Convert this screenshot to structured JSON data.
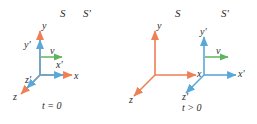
{
  "figure": {
    "background": "#ffffff",
    "width": 257,
    "height": 124,
    "colors": {
      "frame_S": "#ef7f55",
      "frame_S_prime": "#5aa8d8",
      "velocity": "#5fb55f",
      "text": "#2b2b2b"
    }
  },
  "panels": [
    {
      "id": "panel-t0",
      "time_label": "t = 0",
      "frame_labels": {
        "S": "S",
        "S_prime": "S′"
      },
      "axes": [
        {
          "name": "y",
          "label": "y",
          "frame": "S",
          "color": "#ef7f55"
        },
        {
          "name": "x",
          "label": "x",
          "frame": "S",
          "color": "#ef7f55"
        },
        {
          "name": "z",
          "label": "z",
          "frame": "S",
          "color": "#ef7f55"
        },
        {
          "name": "y'",
          "label": "y′",
          "frame": "S'",
          "color": "#5aa8d8"
        },
        {
          "name": "x'",
          "label": "x′",
          "frame": "S'",
          "color": "#5aa8d8"
        },
        {
          "name": "z'",
          "label": "z′",
          "frame": "S'",
          "color": "#5aa8d8"
        }
      ],
      "velocity": {
        "label": "v",
        "color": "#5fb55f",
        "direction": "+x"
      },
      "note": "Origins of S and S' coincide"
    },
    {
      "id": "panel-tgt0",
      "time_label": "t > 0",
      "frame_labels": {
        "S": "S",
        "S_prime": "S′"
      },
      "axes": [
        {
          "name": "y",
          "label": "y",
          "frame": "S",
          "color": "#ef7f55"
        },
        {
          "name": "x",
          "label": "x",
          "frame": "S",
          "color": "#ef7f55"
        },
        {
          "name": "z",
          "label": "z",
          "frame": "S",
          "color": "#ef7f55"
        },
        {
          "name": "y'",
          "label": "y′",
          "frame": "S'",
          "color": "#5aa8d8"
        },
        {
          "name": "x'",
          "label": "x′",
          "frame": "S'",
          "color": "#5aa8d8"
        },
        {
          "name": "z'",
          "label": "z′",
          "frame": "S'",
          "color": "#5aa8d8"
        }
      ],
      "velocity": {
        "label": "v",
        "color": "#5fb55f",
        "direction": "+x"
      },
      "note": "Origin of S' has moved along +x relative to S"
    }
  ]
}
